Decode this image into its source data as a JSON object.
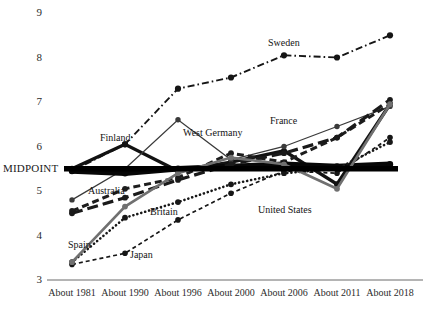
{
  "chart_data": {
    "type": "line",
    "title": "",
    "xlabel": "",
    "ylabel": "",
    "ylim": [
      3,
      9
    ],
    "grid": false,
    "legend_position": "inline-labels",
    "y_ticks": [
      "9",
      "8",
      "7",
      "6",
      "5",
      "4",
      "3"
    ],
    "y_tick_values": [
      9,
      8,
      7,
      6,
      5,
      4,
      3
    ],
    "midpoint_label": "MIDPOINT",
    "midpoint_value": 5.5,
    "categories": [
      "About 1981",
      "About 1990",
      "About 1996",
      "About 2000",
      "About 2006",
      "About 2011",
      "About 2018"
    ],
    "x": [
      1981,
      1990,
      1996,
      2000,
      2006,
      2011,
      2018
    ],
    "series": [
      {
        "name": "Sweden",
        "values": [
          5.45,
          6.05,
          7.3,
          7.55,
          8.05,
          8.0,
          8.5
        ],
        "style": "dash-dot",
        "color": "#151515",
        "label_x": 268,
        "label_y": 38
      },
      {
        "name": "Finland",
        "values": [
          5.5,
          6.05,
          5.45,
          5.65,
          5.9,
          5.15,
          6.95
        ],
        "style": "solid-bold",
        "color": "#121212",
        "label_x": 100,
        "label_y": 133
      },
      {
        "name": "West Germany",
        "values": [
          4.8,
          5.5,
          6.6,
          5.7,
          6.0,
          6.45,
          6.9
        ],
        "style": "solid-thin",
        "color": "#3a3a3a",
        "label_x": 183,
        "label_y": 128
      },
      {
        "name": "France",
        "values": [
          4.55,
          5.05,
          5.3,
          5.85,
          5.65,
          6.2,
          6.95
        ],
        "style": "dashed",
        "color": "#1d1d1d",
        "label_x": 270,
        "label_y": 116
      },
      {
        "name": "Australia",
        "values": [
          5.45,
          5.4,
          5.5,
          5.55,
          5.6,
          5.55,
          5.6
        ],
        "style": "solid-black-heavy",
        "color": "#070707",
        "label_x": 88,
        "label_y": 186
      },
      {
        "name": "Britain",
        "values": [
          4.5,
          4.85,
          5.25,
          5.6,
          5.85,
          6.2,
          7.05
        ],
        "style": "long-dash",
        "color": "#1a1a1a",
        "label_x": 150,
        "label_y": 207
      },
      {
        "name": "United States",
        "values": [
          3.4,
          4.4,
          4.75,
          5.15,
          5.4,
          5.5,
          6.1
        ],
        "style": "dotted",
        "color": "#181818",
        "label_x": 258,
        "label_y": 205
      },
      {
        "name": "Japan",
        "values": [
          3.35,
          3.6,
          4.35,
          4.95,
          5.45,
          5.4,
          6.2
        ],
        "style": "fine-dash",
        "color": "#161616",
        "label_x": 130,
        "label_y": 250
      },
      {
        "name": "Spain",
        "values": [
          3.4,
          4.65,
          5.4,
          5.75,
          5.6,
          5.05,
          6.95
        ],
        "style": "solid-gray",
        "color": "#707070",
        "label_x": 68,
        "label_y": 240
      }
    ]
  },
  "axis": {
    "axis_color": "#6a6a6a"
  }
}
